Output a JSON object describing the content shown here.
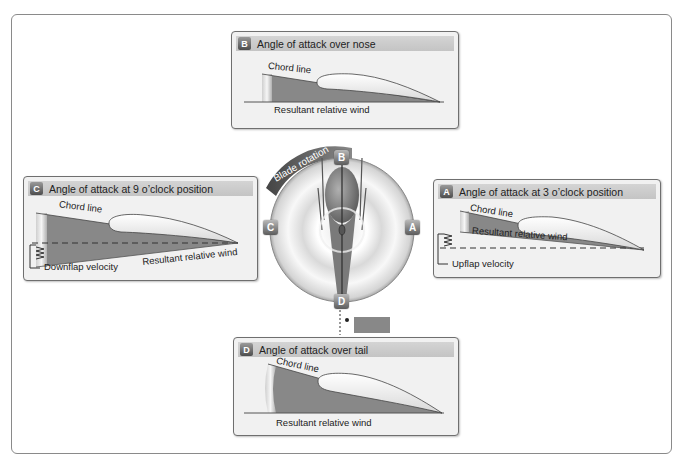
{
  "panels": {
    "B": {
      "letter": "B",
      "title": "Angle of attack over nose",
      "chord_label": "Chord line",
      "wind_label": "Resultant relative wind"
    },
    "C": {
      "letter": "C",
      "title": "Angle of attack at 9 o’clock position",
      "chord_label": "Chord line",
      "wind_label": "Resultant relative wind",
      "velocity_label": "Downflap velocity"
    },
    "A": {
      "letter": "A",
      "title": "Angle of attack at 3 o’clock position",
      "chord_label": "Chord line",
      "wind_label": "Resultant relative wind",
      "velocity_label": "Upflap velocity"
    },
    "D": {
      "letter": "D",
      "title": "Angle of attack over tail",
      "chord_label": "Chord line",
      "wind_label": "Resultant relative wind"
    }
  },
  "hub": {
    "rotation_label": "Blade rotation",
    "positions": {
      "top": "B",
      "left": "C",
      "right": "A",
      "bottom": "D"
    }
  }
}
